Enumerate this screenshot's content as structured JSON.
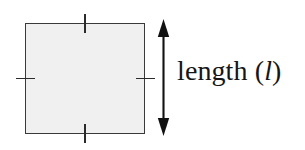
{
  "figure": {
    "background_color": "#ffffff",
    "shape": {
      "name": "square",
      "fill_color": "#f0f0f0",
      "stroke_color": "#3a3a3a",
      "tick_color": "#2b2b2b",
      "tick_count": 4,
      "tick_note": "equal-length congruence marks on all four sides"
    },
    "dimension": {
      "arrow_color": "#111111",
      "arrow_style": "double-headed",
      "arrow_orientation": "vertical",
      "label_text": "length (",
      "label_variable": "l",
      "label_close": ")",
      "label_color": "#161616"
    }
  }
}
